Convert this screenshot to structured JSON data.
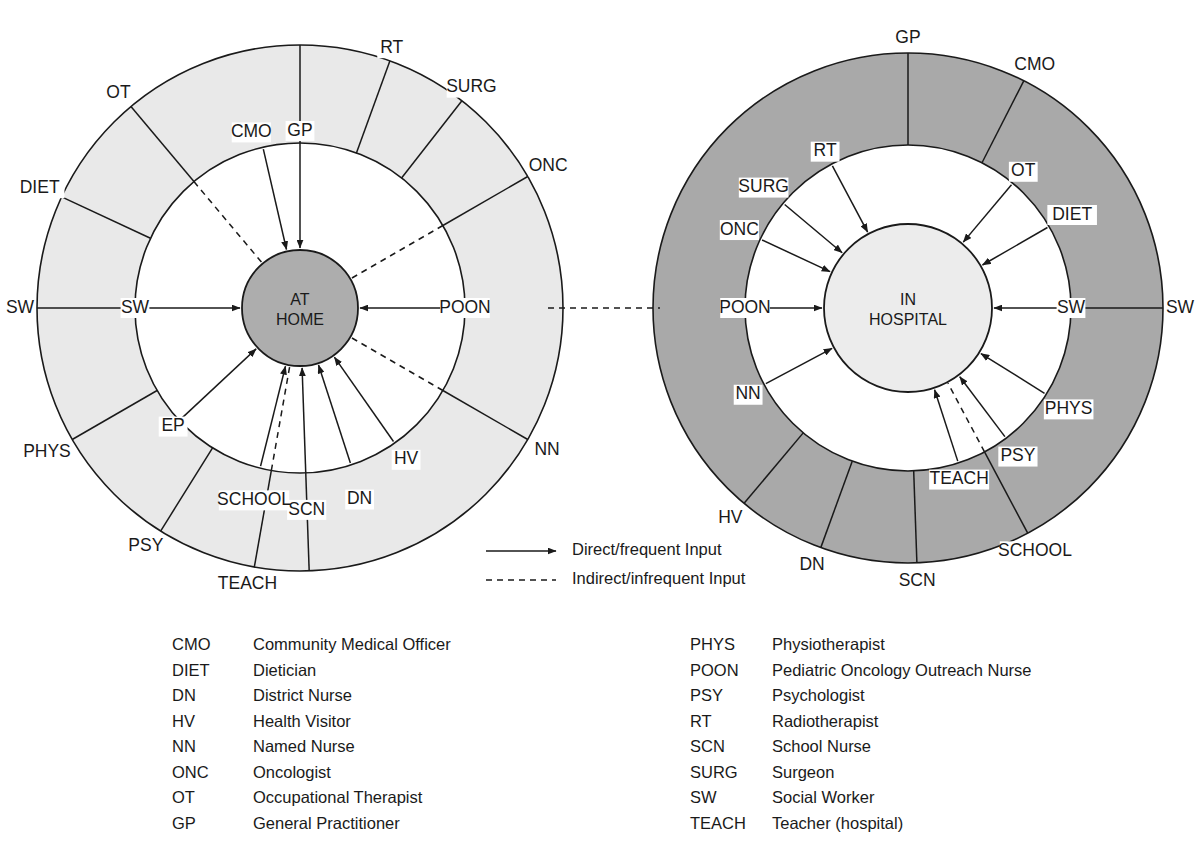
{
  "figure": {
    "colors": {
      "outline": "#1a1a1a",
      "home_hub_fill": "#adadad",
      "home_ring_fill": "#e9e9e9",
      "hospital_hub_fill": "#ececec",
      "hospital_ring_fill": "#a9a9a9",
      "page_background": "#ffffff"
    }
  },
  "diagrams": [
    {
      "id": "at-home",
      "hub_line1": "AT",
      "hub_line2": "HOME",
      "geometry": {
        "cx": 300,
        "cy": 308,
        "r_hub": 58,
        "r_inner": 165,
        "r_outer": 263
      },
      "ring_fill": "#e9e9e9",
      "hub_fill": "#adadad",
      "nodes": [
        {
          "label": "GP",
          "angle": -90,
          "ring": "outer",
          "link": "direct",
          "arrow": true,
          "label_r": 167,
          "label_dx": 0,
          "label_dy": -10
        },
        {
          "label": "RT",
          "angle": -70,
          "ring": "outer",
          "link": "spoke",
          "arrow": false,
          "label_r": 268,
          "label_dx": 0,
          "label_dy": -8
        },
        {
          "label": "SURG",
          "angle": -52,
          "ring": "outer",
          "link": "spoke",
          "arrow": false,
          "label_r": 272,
          "label_dx": 4,
          "label_dy": -6
        },
        {
          "label": "ONC",
          "angle": -30,
          "ring": "outer",
          "link": "indirect",
          "arrow": false,
          "label_r": 275,
          "label_dx": 10,
          "label_dy": -4
        },
        {
          "label": "POON",
          "angle": 0,
          "ring": "inner",
          "link": "direct",
          "arrow": true,
          "label_r": 165,
          "label_dx": 0,
          "label_dy": 0
        },
        {
          "label": "NN",
          "angle": 30,
          "ring": "outer",
          "link": "indirect",
          "arrow": false,
          "label_r": 276,
          "label_dx": 8,
          "label_dy": 4
        },
        {
          "label": "HV",
          "angle": 55,
          "ring": "inner",
          "link": "direct",
          "arrow": true,
          "label_r": 178,
          "label_dx": 4,
          "label_dy": 6
        },
        {
          "label": "DN",
          "angle": 72,
          "ring": "inner",
          "link": "direct",
          "arrow": true,
          "label_r": 193,
          "label_dx": 0,
          "label_dy": 8
        },
        {
          "label": "SCN",
          "angle": 88,
          "ring": "outer",
          "link": "direct",
          "arrow": true,
          "label_r": 192,
          "label_dx": 0,
          "label_dy": 10
        },
        {
          "label": "SCHOOL",
          "angle": 104,
          "ring": "inner",
          "link": "direct",
          "arrow": true,
          "label_r": 190,
          "label_dx": 0,
          "label_dy": 8
        },
        {
          "label": "TEACH",
          "angle": 100,
          "ring": "outer",
          "link": "indirect",
          "arrow": false,
          "label_r": 268,
          "label_dx": -6,
          "label_dy": 12
        },
        {
          "label": "PSY",
          "angle": 122,
          "ring": "outer",
          "link": "spoke",
          "arrow": false,
          "label_r": 272,
          "label_dx": -10,
          "label_dy": 8
        },
        {
          "label": "EP",
          "angle": 137,
          "ring": "inner",
          "link": "direct",
          "arrow": true,
          "label_r": 168,
          "label_dx": -4,
          "label_dy": 4
        },
        {
          "label": "PHYS",
          "angle": 150,
          "ring": "outer",
          "link": "spoke",
          "arrow": false,
          "label_r": 276,
          "label_dx": -14,
          "label_dy": 6
        },
        {
          "label": "SW",
          "angle": 180,
          "ring": "inner",
          "link": "direct",
          "arrow": true,
          "label_r": 165,
          "label_dx": 0,
          "label_dy": 0
        },
        {
          "label": "SW",
          "angle": 180,
          "ring": "outer",
          "link": "spoke",
          "arrow": false,
          "label_r": 272,
          "label_dx": -8,
          "label_dy": 0
        },
        {
          "label": "DIET",
          "angle": -155,
          "ring": "outer",
          "link": "spoke",
          "arrow": false,
          "label_r": 274,
          "label_dx": -12,
          "label_dy": -4
        },
        {
          "label": "OT",
          "angle": -130,
          "ring": "outer",
          "link": "indirect",
          "arrow": false,
          "label_r": 270,
          "label_dx": -8,
          "label_dy": -8
        },
        {
          "label": "CMO",
          "angle": -103,
          "ring": "inner",
          "link": "direct",
          "arrow": true,
          "label_r": 172,
          "label_dx": -10,
          "label_dy": -8
        }
      ]
    },
    {
      "id": "in-hospital",
      "hub_line1": "IN",
      "hub_line2": "HOSPITAL",
      "geometry": {
        "cx": 908,
        "cy": 308,
        "r_hub": 84,
        "r_inner": 163,
        "r_outer": 255
      },
      "ring_fill": "#a9a9a9",
      "hub_fill": "#ececec",
      "nodes": [
        {
          "label": "GP",
          "angle": -90,
          "ring": "outer",
          "link": "spoke",
          "arrow": false,
          "label_r": 262,
          "label_dx": 0,
          "label_dy": -8
        },
        {
          "label": "CMO",
          "angle": -63,
          "ring": "outer",
          "link": "spoke",
          "arrow": false,
          "label_r": 266,
          "label_dx": 6,
          "label_dy": -6
        },
        {
          "label": "OT",
          "angle": -50,
          "ring": "inner",
          "link": "direct",
          "arrow": true,
          "label_r": 170,
          "label_dx": 6,
          "label_dy": -6
        },
        {
          "label": "DIET",
          "angle": -30,
          "ring": "inner",
          "link": "direct",
          "arrow": true,
          "label_r": 178,
          "label_dx": 10,
          "label_dy": -4
        },
        {
          "label": "SW",
          "angle": 0,
          "ring": "inner",
          "link": "direct",
          "arrow": true,
          "label_r": 163,
          "label_dx": 0,
          "label_dy": 0
        },
        {
          "label": "SW",
          "angle": 0,
          "ring": "outer",
          "link": "spoke",
          "arrow": false,
          "label_r": 264,
          "label_dx": 8,
          "label_dy": 0
        },
        {
          "label": "PHYS",
          "angle": 32,
          "ring": "inner",
          "link": "direct",
          "arrow": true,
          "label_r": 180,
          "label_dx": 8,
          "label_dy": 6
        },
        {
          "label": "PSY",
          "angle": 53,
          "ring": "inner",
          "link": "direct",
          "arrow": true,
          "label_r": 176,
          "label_dx": 4,
          "label_dy": 8
        },
        {
          "label": "TEACH",
          "angle": 72,
          "ring": "inner",
          "link": "direct",
          "arrow": true,
          "label_r": 172,
          "label_dx": -2,
          "label_dy": 8
        },
        {
          "label": "SCHOOL",
          "angle": 62,
          "ring": "outer",
          "link": "indirect",
          "arrow": false,
          "label_r": 262,
          "label_dx": 4,
          "label_dy": 12
        },
        {
          "label": "SCN",
          "angle": 88,
          "ring": "outer",
          "link": "spoke",
          "arrow": false,
          "label_r": 262,
          "label_dx": 0,
          "label_dy": 12
        },
        {
          "label": "DN",
          "angle": 110,
          "ring": "outer",
          "link": "spoke",
          "arrow": false,
          "label_r": 263,
          "label_dx": -6,
          "label_dy": 10
        },
        {
          "label": "HV",
          "angle": 130,
          "ring": "outer",
          "link": "spoke",
          "arrow": false,
          "label_r": 264,
          "label_dx": -8,
          "label_dy": 8
        },
        {
          "label": "NN",
          "angle": 152,
          "ring": "inner",
          "link": "direct",
          "arrow": true,
          "label_r": 172,
          "label_dx": -8,
          "label_dy": 6
        },
        {
          "label": "POON",
          "angle": 180,
          "ring": "inner",
          "link": "direct",
          "arrow": true,
          "label_r": 163,
          "label_dx": 0,
          "label_dy": 0
        },
        {
          "label": "ONC",
          "angle": -155,
          "ring": "inner",
          "link": "direct",
          "arrow": true,
          "label_r": 175,
          "label_dx": -10,
          "label_dy": -4
        },
        {
          "label": "SURG",
          "angle": -140,
          "ring": "inner",
          "link": "direct",
          "arrow": true,
          "label_r": 178,
          "label_dx": -8,
          "label_dy": -6
        },
        {
          "label": "RT",
          "angle": -118,
          "ring": "inner",
          "link": "direct",
          "arrow": true,
          "label_r": 168,
          "label_dx": -4,
          "label_dy": -8
        }
      ]
    }
  ],
  "connector": {
    "style": "indirect",
    "from_x": 548,
    "to_x": 660,
    "y": 308
  },
  "legend": {
    "items": [
      {
        "style": "solid",
        "label": "Direct/frequent Input"
      },
      {
        "style": "dashed",
        "label": "Indirect/infrequent Input"
      }
    ],
    "x_line_start": 486,
    "x_line_end": 556,
    "x_text": 572,
    "y_first": 551,
    "y_step": 29
  },
  "abbreviations": {
    "left_column": [
      {
        "code": "CMO",
        "text": "Community Medical Officer"
      },
      {
        "code": "DIET",
        "text": "Dietician"
      },
      {
        "code": "DN",
        "text": "District Nurse"
      },
      {
        "code": "HV",
        "text": "Health Visitor"
      },
      {
        "code": "NN",
        "text": "Named Nurse"
      },
      {
        "code": "ONC",
        "text": "Oncologist"
      },
      {
        "code": "OT",
        "text": "Occupational Therapist"
      },
      {
        "code": "GP",
        "text": "General Practitioner"
      }
    ],
    "right_column": [
      {
        "code": "PHYS",
        "text": "Physiotherapist"
      },
      {
        "code": "POON",
        "text": "Pediatric Oncology Outreach Nurse"
      },
      {
        "code": "PSY",
        "text": "Psychologist"
      },
      {
        "code": "RT",
        "text": "Radiotherapist"
      },
      {
        "code": "SCN",
        "text": "School Nurse"
      },
      {
        "code": "SURG",
        "text": "Surgeon"
      },
      {
        "code": "SW",
        "text": "Social Worker"
      },
      {
        "code": "TEACH",
        "text": "Teacher (hospital)"
      }
    ],
    "layout": {
      "left_code_x": 172,
      "left_text_x": 253,
      "right_code_x": 690,
      "right_text_x": 772,
      "y_first": 646,
      "y_step": 25.5
    }
  }
}
